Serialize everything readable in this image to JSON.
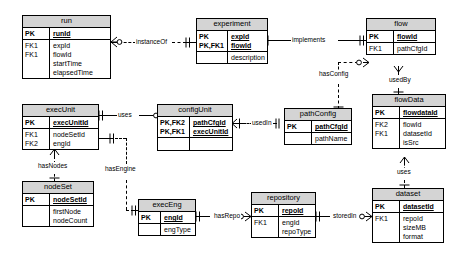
{
  "diagram": {
    "notation": "crows-foot",
    "entities": [
      {
        "id": "run",
        "name": "run",
        "keys": [
          "PK"
        ],
        "pk_attrs": [
          "runId"
        ],
        "attr_keys": [
          "FK1",
          "FK1",
          "",
          ""
        ],
        "attrs": [
          "expId",
          "flowId",
          "startTime",
          "elapsedTime"
        ]
      },
      {
        "id": "experiment",
        "name": "experiment",
        "keys": [
          "PK",
          "PK,FK1"
        ],
        "pk_attrs": [
          "expId",
          "flowId"
        ],
        "attr_keys": [
          ""
        ],
        "attrs": [
          "description"
        ]
      },
      {
        "id": "flow",
        "name": "flow",
        "keys": [
          "PK"
        ],
        "pk_attrs": [
          "flowId"
        ],
        "attr_keys": [
          "FK1"
        ],
        "attrs": [
          "pathCfgId"
        ]
      },
      {
        "id": "execUnit",
        "name": "execUnit",
        "keys": [
          "PK"
        ],
        "pk_attrs": [
          "execUnitId"
        ],
        "attr_keys": [
          "FK1",
          "FK2"
        ],
        "attrs": [
          "nodeSetId",
          "engId"
        ]
      },
      {
        "id": "configUnit",
        "name": "configUnit",
        "keys": [
          "PK,FK2",
          "PK,FK1"
        ],
        "pk_attrs": [
          "pathCfgId",
          "execUnitId"
        ],
        "attr_keys": [
          ""
        ],
        "attrs": [
          ""
        ]
      },
      {
        "id": "pathConfig",
        "name": "pathConfig",
        "keys": [
          "PK"
        ],
        "pk_attrs": [
          "pathCfgId"
        ],
        "attr_keys": [
          ""
        ],
        "attrs": [
          "pathName"
        ]
      },
      {
        "id": "flowData",
        "name": "flowData",
        "keys": [
          "PK"
        ],
        "pk_attrs": [
          "flowdataId"
        ],
        "attr_keys": [
          "FK2",
          "FK1",
          ""
        ],
        "attrs": [
          "flowId",
          "datasetId",
          "isSrc"
        ]
      },
      {
        "id": "nodeSet",
        "name": "nodeSet",
        "keys": [
          "PK"
        ],
        "pk_attrs": [
          "nodeSetId"
        ],
        "attr_keys": [
          "",
          ""
        ],
        "attrs": [
          "firstNode",
          "nodeCount"
        ]
      },
      {
        "id": "execEng",
        "name": "execEng",
        "keys": [
          "PK"
        ],
        "pk_attrs": [
          "engId"
        ],
        "attr_keys": [
          ""
        ],
        "attrs": [
          "engType"
        ]
      },
      {
        "id": "repository",
        "name": "repository",
        "keys": [
          "PK"
        ],
        "pk_attrs": [
          "repoId"
        ],
        "attr_keys": [
          "FK1",
          ""
        ],
        "attrs": [
          "engId",
          "repoType"
        ]
      },
      {
        "id": "dataset",
        "name": "dataset",
        "keys": [
          "PK"
        ],
        "pk_attrs": [
          "datasetId"
        ],
        "attr_keys": [
          "FK1",
          "",
          ""
        ],
        "attrs": [
          "repoId",
          "sizeMB",
          "format"
        ]
      }
    ],
    "relationships": [
      {
        "id": "instanceOf",
        "label": "instanceOf",
        "from": "run",
        "to": "experiment",
        "style": "dashed"
      },
      {
        "id": "implements",
        "label": "implements",
        "from": "experiment",
        "to": "flow",
        "style": "solid"
      },
      {
        "id": "hasConfig",
        "label": "hasConfig",
        "from": "pathConfig",
        "to": "flow",
        "style": "dashed"
      },
      {
        "id": "usedBy",
        "label": "usedBy",
        "from": "flowData",
        "to": "flow",
        "style": "dashed"
      },
      {
        "id": "uses_cfg",
        "label": "uses",
        "from": "execUnit",
        "to": "configUnit",
        "style": "solid"
      },
      {
        "id": "usedIn",
        "label": "usedIn",
        "from": "configUnit",
        "to": "pathConfig",
        "style": "dashed"
      },
      {
        "id": "hasNodes",
        "label": "hasNodes",
        "from": "execUnit",
        "to": "nodeSet",
        "style": "dashed"
      },
      {
        "id": "hasEngine",
        "label": "hasEngine",
        "from": "execUnit",
        "to": "execEng",
        "style": "dashed"
      },
      {
        "id": "hasRepo",
        "label": "hasRepo",
        "from": "execEng",
        "to": "repository",
        "style": "dashed"
      },
      {
        "id": "storedIn",
        "label": "storedIn",
        "from": "repository",
        "to": "dataset",
        "style": "dashed"
      },
      {
        "id": "uses_ds",
        "label": "uses",
        "from": "flowData",
        "to": "dataset",
        "style": "dashed"
      }
    ]
  }
}
